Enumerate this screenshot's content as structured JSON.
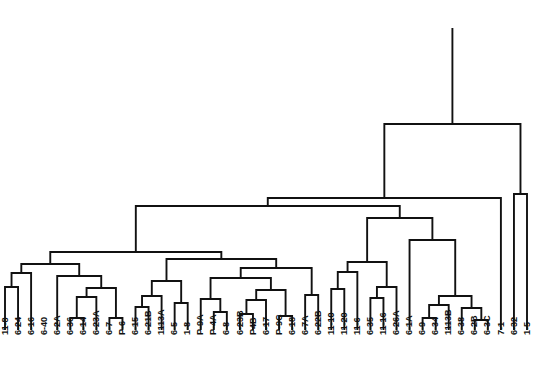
{
  "chart_data": {
    "type": "dendrogram",
    "title": "",
    "subtitle": "",
    "xlabel": "",
    "ylabel": "",
    "orientation": "vertical-top-root",
    "grid": false,
    "legend": null,
    "axes_visible": false,
    "colors": {
      "line": "#111111",
      "background": "#ffffff",
      "label": "#111111"
    },
    "geometry": {
      "width": 543,
      "height": 392,
      "leaf_baseline_y": 330,
      "label_top_y": 334,
      "first_leaf_x": 5,
      "leaf_spacing": 13.05,
      "root_top_y": 28,
      "line_width": 1.9
    },
    "leaf_labels": [
      "11-8",
      "6-24",
      "6-16",
      "6-40",
      "6-2A",
      "6-36",
      "6-14",
      "6-23A",
      "6-7",
      "P-6",
      "6-15",
      "6-21B",
      "1113A",
      "6-5",
      "1-8",
      "P-9A",
      "P-4A",
      "6-8",
      "6-23B",
      "P4B",
      "6-17",
      "P-9C",
      "6-18",
      "6-7A",
      "6-22B",
      "11-10",
      "11-20",
      "11-6",
      "6-35",
      "11-16",
      "6-26A",
      "6-1A",
      "6-9",
      "6-34",
      "1113B",
      "6-38",
      "6-2B",
      "6-3C",
      "7-1",
      "6-32",
      "1-5"
    ],
    "leaf_count": 41,
    "merges": [
      {
        "id": "m1",
        "left": "leaf:1",
        "right": "leaf:2",
        "y": 287
      },
      {
        "id": "m2",
        "left": "m1",
        "right": "leaf:3",
        "y": 273
      },
      {
        "id": "m3",
        "left": "leaf:6",
        "right": "leaf:7",
        "y": 318
      },
      {
        "id": "m4",
        "left": "m3",
        "right": "leaf:8",
        "y": 297
      },
      {
        "id": "m5",
        "left": "leaf:9",
        "right": "leaf:10",
        "y": 318
      },
      {
        "id": "m6",
        "left": "m4",
        "right": "m5",
        "y": 288
      },
      {
        "id": "m7",
        "left": "leaf:5",
        "right": "m6",
        "y": 276
      },
      {
        "id": "m8",
        "left": "m2",
        "right": "m7",
        "y": 264
      },
      {
        "id": "m9",
        "left": "leaf:11",
        "right": "leaf:12",
        "y": 307
      },
      {
        "id": "m10",
        "left": "m9",
        "right": "leaf:13",
        "y": 296
      },
      {
        "id": "m11",
        "left": "leaf:14",
        "right": "leaf:15",
        "y": 303
      },
      {
        "id": "m12",
        "left": "m10",
        "right": "m11",
        "y": 281
      },
      {
        "id": "m13",
        "left": "leaf:17",
        "right": "leaf:18",
        "y": 312
      },
      {
        "id": "m14",
        "left": "leaf:16",
        "right": "m13",
        "y": 299
      },
      {
        "id": "m15",
        "left": "leaf:19",
        "right": "leaf:20",
        "y": 314
      },
      {
        "id": "m16",
        "left": "m15",
        "right": "leaf:21",
        "y": 300
      },
      {
        "id": "m17",
        "left": "leaf:22",
        "right": "leaf:23",
        "y": 316
      },
      {
        "id": "m18",
        "left": "m16",
        "right": "m17",
        "y": 290
      },
      {
        "id": "m19",
        "left": "m14",
        "right": "m18",
        "y": 278
      },
      {
        "id": "m20",
        "left": "leaf:24",
        "right": "leaf:25",
        "y": 295
      },
      {
        "id": "m21",
        "left": "m19",
        "right": "m20",
        "y": 268
      },
      {
        "id": "m22",
        "left": "m12",
        "right": "m21",
        "y": 259
      },
      {
        "id": "m23",
        "left": "m8",
        "right": "m22",
        "y": 252
      },
      {
        "id": "m24",
        "left": "leaf:26",
        "right": "leaf:27",
        "y": 289
      },
      {
        "id": "m25",
        "left": "m24",
        "right": "leaf:28",
        "y": 272
      },
      {
        "id": "m26",
        "left": "leaf:29",
        "right": "leaf:30",
        "y": 298
      },
      {
        "id": "m27",
        "left": "m26",
        "right": "leaf:31",
        "y": 287
      },
      {
        "id": "m28",
        "left": "m25",
        "right": "m27",
        "y": 262
      },
      {
        "id": "m29",
        "left": "leaf:33",
        "right": "leaf:34",
        "y": 318
      },
      {
        "id": "m30",
        "left": "m29",
        "right": "leaf:35",
        "y": 305
      },
      {
        "id": "m31",
        "left": "leaf:37",
        "right": "leaf:38",
        "y": 320
      },
      {
        "id": "m32",
        "left": "leaf:36",
        "right": "m31",
        "y": 308
      },
      {
        "id": "m33",
        "left": "m30",
        "right": "m32",
        "y": 296
      },
      {
        "id": "m34",
        "left": "leaf:32",
        "right": "m33",
        "y": 240
      },
      {
        "id": "m35",
        "left": "m28",
        "right": "m34",
        "y": 218
      },
      {
        "id": "m36",
        "left": "m23",
        "right": "m35",
        "y": 206
      },
      {
        "id": "m37",
        "left": "m36",
        "right": "leaf:39",
        "y": 198
      },
      {
        "id": "m38",
        "left": "leaf:40",
        "right": "leaf:41",
        "y": 194
      },
      {
        "id": "m39",
        "left": "m37",
        "right": "m38",
        "y": 124
      }
    ],
    "root": "m39"
  }
}
